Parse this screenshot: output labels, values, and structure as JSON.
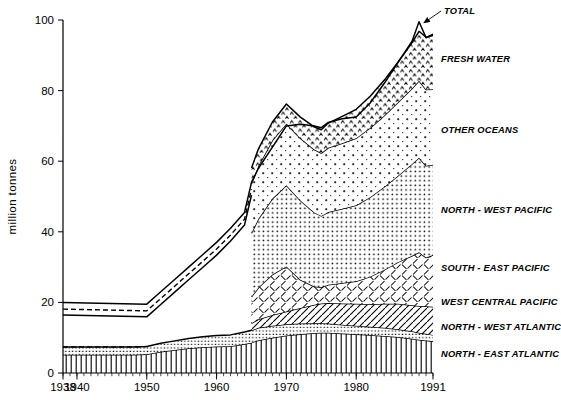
{
  "chart_data": {
    "type": "area",
    "subtype": "stacked-area",
    "title": "",
    "xlabel": "",
    "ylabel": "million  tonnes",
    "xlim": [
      1938,
      1991
    ],
    "ylim": [
      0,
      100
    ],
    "yticks": [
      0,
      20,
      40,
      60,
      80,
      100
    ],
    "xticks": [
      1938,
      1940,
      1950,
      1960,
      1970,
      1980,
      1991
    ],
    "xticklabels": [
      "1938",
      "1940",
      "1950",
      "1960",
      "1970",
      "1980",
      "1991"
    ],
    "grid": false,
    "legend_position": "right-inline",
    "annotations": [
      {
        "text": "TOTAL",
        "points_to_year": 1989,
        "points_to_value": 100
      }
    ],
    "x": [
      1938,
      1940,
      1942,
      1944,
      1946,
      1948,
      1950,
      1952,
      1954,
      1956,
      1958,
      1960,
      1962,
      1964,
      1965,
      1966,
      1968,
      1970,
      1972,
      1974,
      1975,
      1976,
      1978,
      1980,
      1982,
      1984,
      1986,
      1988,
      1989,
      1990,
      1991
    ],
    "series": [
      {
        "name": "NORTH - EAST ATLANTIC",
        "pattern": "vertical-lines",
        "values": [
          5.2,
          5.2,
          5.2,
          5.2,
          5.2,
          5.2,
          5.3,
          6.0,
          6.5,
          7.0,
          7.3,
          7.5,
          7.6,
          8.2,
          8.6,
          9.3,
          10.0,
          10.6,
          11.0,
          11.3,
          11.4,
          11.4,
          11.2,
          11.0,
          10.8,
          10.5,
          10.2,
          9.7,
          9.4,
          9.2,
          9.0
        ]
      },
      {
        "name": "NORTH - WEST ATLANTIC",
        "pattern": "fine-dots",
        "values": [
          2.2,
          2.2,
          2.2,
          2.2,
          2.2,
          2.2,
          2.2,
          2.4,
          2.6,
          2.8,
          3.0,
          3.1,
          3.2,
          3.4,
          3.5,
          3.5,
          3.4,
          3.2,
          3.0,
          2.8,
          2.7,
          2.6,
          2.5,
          2.4,
          2.3,
          2.3,
          2.2,
          2.1,
          2.0,
          1.9,
          1.8
        ]
      },
      {
        "name": "WEST CENTRAL PACIFIC",
        "pattern": "diagonal-hatch-right",
        "values": [
          0,
          0,
          0,
          0,
          0,
          0,
          0,
          0,
          0,
          0,
          0,
          0,
          0,
          0,
          2.0,
          2.4,
          3.0,
          3.6,
          4.4,
          5.2,
          5.6,
          5.8,
          6.0,
          6.2,
          6.4,
          6.8,
          7.2,
          7.4,
          7.6,
          7.8,
          8.0
        ]
      },
      {
        "name": "SOUTH - EAST PACIFIC",
        "pattern": "cross-hatch-sparse",
        "values": [
          0,
          0,
          0,
          0,
          0,
          0,
          0,
          0,
          0,
          0,
          0,
          0,
          0,
          0,
          7.5,
          9.0,
          11.5,
          12.8,
          8.0,
          5.2,
          4.6,
          5.2,
          5.8,
          6.4,
          7.8,
          9.6,
          11.8,
          14.0,
          15.2,
          13.8,
          14.6
        ]
      },
      {
        "name": "NORTH - WEST PACIFIC",
        "pattern": "medium-dots",
        "values": [
          0,
          0,
          0,
          0,
          0,
          0,
          0,
          0,
          0,
          0,
          0,
          0,
          0,
          0,
          18.0,
          19.5,
          21.5,
          23.0,
          22.5,
          21.0,
          20.2,
          20.6,
          21.0,
          21.5,
          22.5,
          23.5,
          24.5,
          26.0,
          26.8,
          26.0,
          25.6
        ]
      },
      {
        "name": "OTHER OCEANS",
        "pattern": "sparse-dots-plus",
        "values": [
          0,
          0,
          0,
          0,
          0,
          0,
          0,
          0,
          0,
          0,
          0,
          0,
          0,
          0,
          14.0,
          15.0,
          16.5,
          17.4,
          17.6,
          17.8,
          17.8,
          18.2,
          18.6,
          19.0,
          19.6,
          20.2,
          20.8,
          21.4,
          21.8,
          21.6,
          21.4
        ]
      },
      {
        "name": "FRESH WATER",
        "pattern": "triangle-dots",
        "values": [
          0,
          0,
          0,
          0,
          0,
          0,
          0,
          0,
          0,
          0,
          0,
          0,
          0,
          0,
          4.5,
          4.8,
          5.2,
          5.6,
          6.0,
          6.4,
          6.6,
          7.0,
          7.6,
          8.2,
          9.0,
          10.0,
          11.4,
          13.0,
          14.0,
          14.8,
          15.2
        ]
      }
    ],
    "total_line": {
      "name": "TOTAL",
      "years": [
        1938,
        1950,
        1952,
        1954,
        1956,
        1958,
        1960,
        1962,
        1964,
        1965,
        1966,
        1968,
        1970,
        1972,
        1974,
        1975,
        1976,
        1978,
        1980,
        1982,
        1984,
        1986,
        1988,
        1989,
        1990,
        1991
      ],
      "values": [
        20.0,
        19.5,
        23.0,
        26.5,
        30.0,
        33.5,
        37.0,
        41.0,
        45.5,
        54.0,
        58.0,
        64.0,
        70.0,
        70.5,
        70.0,
        69.5,
        71.0,
        72.0,
        72.5,
        76.5,
        82.0,
        88.0,
        94.0,
        99.5,
        95.0,
        96.0
      ]
    },
    "pre1950_note": "Dashed bands 1938-1950 indicate estimated/interpolated totals"
  },
  "axes": {
    "y_title": "million  tonnes",
    "y_ticks": [
      "0",
      "20",
      "40",
      "60",
      "80",
      "100"
    ],
    "x_ticks": [
      "1938",
      "1940",
      "1950",
      "1960",
      "1970",
      "1980",
      "1991"
    ]
  },
  "labels": {
    "total": "TOTAL",
    "fresh_water": "FRESH WATER",
    "other_oceans": "OTHER OCEANS",
    "north_west_pacific": "NORTH - WEST PACIFIC",
    "south_east_pacific": "SOUTH - EAST PACIFIC",
    "west_central_pacific": "WEST CENTRAL PACIFIC",
    "north_west_atlantic": "NORTH - WEST ATLANTIC",
    "north_east_atlantic": "NORTH - EAST ATLANTIC"
  },
  "caption": {
    "text": ""
  },
  "colors": {
    "ink": "#000000",
    "background": "#ffffff"
  }
}
